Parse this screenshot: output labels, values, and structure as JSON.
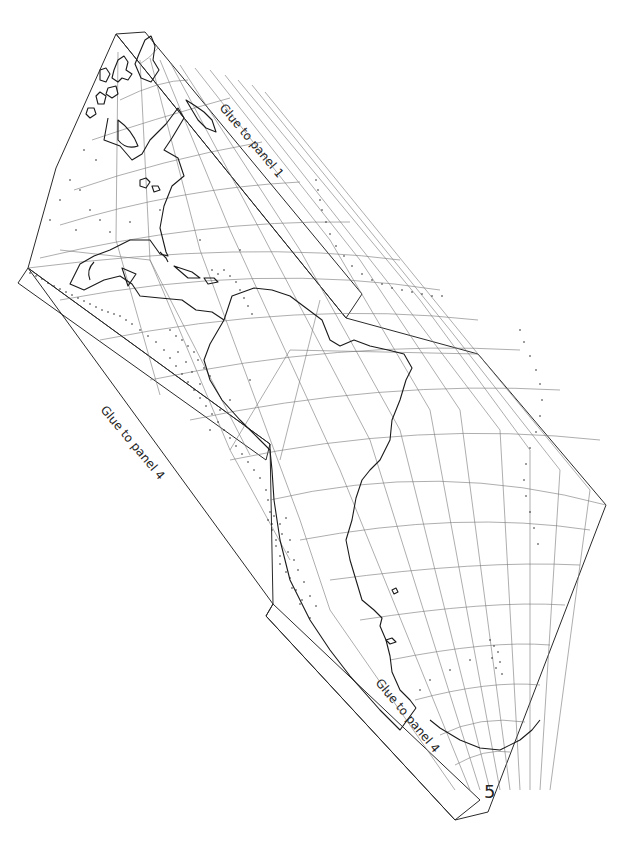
{
  "map": {
    "title": "",
    "panel_number": "5",
    "glue_labels": {
      "top_right": "Glue to panel 1",
      "left": "Glue to panel 4",
      "bottom": "Glue to panel 4"
    },
    "colors": {
      "outline": "#2a2a2a",
      "graticule": "#777777",
      "coastline": "#1a1a1a",
      "points": "#222222",
      "background": "#ffffff"
    },
    "description": "Cut-out polyhedral globe panel showing North America, Central America, South America and the western Atlantic with a dotted earthquake/volcano distribution and graticule lines"
  }
}
